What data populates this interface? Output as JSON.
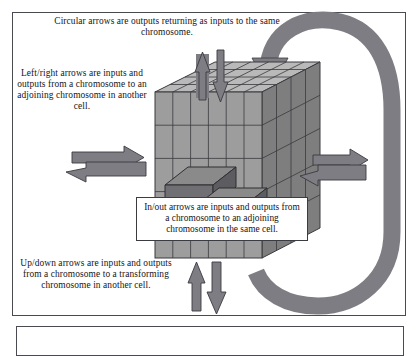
{
  "figure": {
    "kind": "conceptual-diagram",
    "background_color": "#ffffff",
    "frame_color": "#4a4a52"
  },
  "captions": {
    "top": "Circular arrows are outputs returning as inputs to the same chromosome.",
    "left": "Left/right arrows are inputs and outputs from a chromosome to an adjoining chromosome in another cell.",
    "center": "In/out arrows are inputs and outputs from a chromosome to an adjoining chromosome in the same cell.",
    "bottom": "Up/down arrows are inputs and outputs from a chromosome to a transforming chromosome in another cell."
  },
  "cube": {
    "label": "chromosome-lattice-cube",
    "columns": 6,
    "rows": 5,
    "depth_layers": 4,
    "face_colors": {
      "top": "#b9b9b9",
      "front": "#9d9d9d",
      "side": "#7e7e7e",
      "edge": "#3a3a3f"
    }
  },
  "arrows": {
    "fill": "#7d7d83",
    "stroke": "#3a3a3f",
    "groups": [
      {
        "name": "up-down-top",
        "icons": [
          "arrow-up-icon",
          "arrow-down-icon"
        ]
      },
      {
        "name": "up-down-bottom",
        "icons": [
          "arrow-up-icon",
          "arrow-down-icon"
        ]
      },
      {
        "name": "left-right-west",
        "icons": [
          "arrow-right-icon",
          "arrow-left-icon"
        ]
      },
      {
        "name": "left-right-east",
        "icons": [
          "arrow-right-icon",
          "arrow-left-icon"
        ]
      },
      {
        "name": "in-out-blocks",
        "icons": [
          "block-out-icon",
          "block-in-icon"
        ]
      },
      {
        "name": "circular-return",
        "icons": [
          "circular-arrow-icon"
        ]
      }
    ]
  }
}
